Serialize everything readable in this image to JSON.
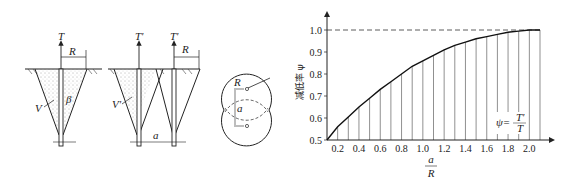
{
  "diagram": {
    "single_anchor": {
      "force_label": "T",
      "radius_label": "R",
      "volume_label": "V",
      "angle_label": "β"
    },
    "twin_anchor": {
      "force_label_left": "T'",
      "force_label_right": "T'",
      "radius_label": "R",
      "volume_label": "V'",
      "spacing_label": "a"
    },
    "plan_view": {
      "radius_label": "R",
      "spacing_label": "a"
    }
  },
  "chart_data": {
    "type": "line",
    "title": "",
    "xlabel_num": "a",
    "xlabel_den": "R",
    "ylabel": "减低率 ψ",
    "annotation": {
      "lhs": "ψ=",
      "num": "T'",
      "den": "T"
    },
    "xlim": [
      0.1,
      2.1
    ],
    "ylim": [
      0.5,
      1.0
    ],
    "x_ticks": [
      "0.2",
      "0.4",
      "0.6",
      "0.8",
      "1.0",
      "1.2",
      "1.4",
      "1.6",
      "1.8",
      "2.0"
    ],
    "y_ticks": [
      "0.5",
      "0.6",
      "0.7",
      "0.8",
      "0.9",
      "1.0"
    ],
    "reference_line": {
      "y": 1.0,
      "style": "dashed"
    },
    "grid": "vertical lines every 0.1",
    "x": [
      0.1,
      0.2,
      0.3,
      0.4,
      0.5,
      0.6,
      0.7,
      0.8,
      0.9,
      1.0,
      1.1,
      1.2,
      1.3,
      1.4,
      1.5,
      1.6,
      1.7,
      1.8,
      1.9,
      2.0,
      2.1
    ],
    "values": [
      0.5,
      0.56,
      0.605,
      0.65,
      0.69,
      0.73,
      0.765,
      0.8,
      0.835,
      0.86,
      0.885,
      0.91,
      0.93,
      0.945,
      0.96,
      0.97,
      0.98,
      0.99,
      0.995,
      1.0,
      1.0
    ]
  }
}
